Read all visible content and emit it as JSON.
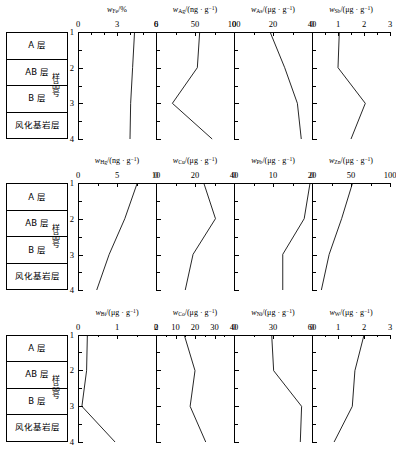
{
  "figure": {
    "y_axis_caption": "样品号",
    "sample_numbers": [
      "1",
      "2",
      "3",
      "4"
    ],
    "stratigraphy": [
      {
        "label": "A 层"
      },
      {
        "label": "AB 层"
      },
      {
        "label": "B 层"
      },
      {
        "label": "风化基\n岩层"
      }
    ]
  },
  "chart_data": {
    "type": "line",
    "title": "",
    "ylabel": "样品号",
    "ylim": [
      1,
      4
    ],
    "y": [
      1,
      2,
      3,
      4
    ],
    "grid": false,
    "legend": "none",
    "orientation": "depth-profile (y inverted, sample number increases downward)",
    "panels": [
      {
        "row": 1,
        "col": 1,
        "element": "Fe",
        "symbol": "w",
        "subscript": "Fe",
        "unit": "%",
        "xlabel": "w_Fe/%",
        "xlim": [
          0,
          6
        ],
        "xticks": [
          0,
          3,
          6
        ],
        "xticklabels": [
          "0",
          "3",
          "6"
        ],
        "minor_ticks": [
          1,
          2,
          4,
          5
        ],
        "values": [
          4.35,
          4.2,
          4.05,
          4.0
        ]
      },
      {
        "row": 1,
        "col": 2,
        "element": "Ag",
        "symbol": "w",
        "subscript": "Ag",
        "unit": "ng·g-1",
        "xlabel": "w_Ag/(ng · g^-1)",
        "xlim": [
          0,
          100
        ],
        "xticks": [
          0,
          50,
          100
        ],
        "xticklabels": [
          "0",
          "50",
          "100"
        ],
        "minor_ticks": [
          25,
          75
        ],
        "values": [
          56,
          53,
          21,
          72
        ]
      },
      {
        "row": 1,
        "col": 3,
        "element": "As",
        "symbol": "w",
        "subscript": "As",
        "unit": "μg·g-1",
        "xlabel": "w_As/(μg · g^-1)",
        "xlim": [
          0,
          40
        ],
        "xticks": [
          0,
          20,
          40
        ],
        "xticklabels": [
          "0",
          "20",
          "40"
        ],
        "minor_ticks": [
          10,
          30
        ],
        "values": [
          18.5,
          26.0,
          32.5,
          34.5
        ]
      },
      {
        "row": 1,
        "col": 4,
        "element": "Sb",
        "symbol": "w",
        "subscript": "Sb",
        "unit": "μg·g-1",
        "xlabel": "w_Sb/(μg · g^-1)",
        "xlim": [
          0,
          3
        ],
        "xticks": [
          0,
          1,
          2,
          3
        ],
        "xticklabels": [
          "0",
          "1",
          "2",
          "3"
        ],
        "minor_ticks": [
          0.5,
          1.5,
          2.5
        ],
        "values": [
          1.05,
          1.0,
          2.05,
          1.5
        ]
      },
      {
        "row": 2,
        "col": 1,
        "element": "Hg",
        "symbol": "w",
        "subscript": "Hg",
        "unit": "ng·g-1",
        "xlabel": "w_Hg/(ng · g^-1)",
        "xlim": [
          0,
          10
        ],
        "xticks": [
          0,
          5,
          10
        ],
        "xticklabels": [
          "0",
          "5",
          "10"
        ],
        "minor_ticks": [
          2.5,
          7.5
        ],
        "values": [
          7.6,
          6.0,
          4.0,
          2.4
        ]
      },
      {
        "row": 2,
        "col": 2,
        "element": "Cu",
        "symbol": "w",
        "subscript": "Cu",
        "unit": "μg·g-1",
        "xlabel": "w_Cu/(μg · g^-1)",
        "xlim": [
          0,
          40
        ],
        "xticks": [
          0,
          20,
          40
        ],
        "xticklabels": [
          "0",
          "20",
          "40"
        ],
        "minor_ticks": [
          10,
          30
        ],
        "values": [
          24.5,
          30.5,
          19.0,
          15.0
        ]
      },
      {
        "row": 2,
        "col": 3,
        "element": "Pb",
        "symbol": "w",
        "subscript": "Pb",
        "unit": "μg·g-1",
        "xlabel": "w_Pb/(μg · g^-1)",
        "xlim": [
          0,
          20
        ],
        "xticks": [
          0,
          10,
          20
        ],
        "xticklabels": [
          "0",
          "10",
          "20"
        ],
        "minor_ticks": [
          5,
          15
        ],
        "values": [
          19.5,
          18.0,
          12.5,
          12.5
        ]
      },
      {
        "row": 2,
        "col": 4,
        "element": "Zn",
        "symbol": "w",
        "subscript": "Zn",
        "unit": "μg·g-1",
        "xlabel": "w_Zn/(μg · g^-1)",
        "xlim": [
          0,
          100
        ],
        "xticks": [
          0,
          50,
          100
        ],
        "xticklabels": [
          "0",
          "50",
          "100"
        ],
        "minor_ticks": [
          25,
          75
        ],
        "values": [
          52,
          38,
          22,
          12
        ]
      },
      {
        "row": 3,
        "col": 1,
        "element": "Bi",
        "symbol": "w",
        "subscript": "Bi",
        "unit": "μg·g-1",
        "xlabel": "w_Bi/(μg · g^-1)",
        "xlim": [
          0,
          2
        ],
        "xticks": [
          0,
          1,
          2
        ],
        "xticklabels": [
          "0",
          "1",
          "2"
        ],
        "minor_ticks": [
          0.5,
          1.5
        ],
        "values": [
          0.24,
          0.22,
          0.1,
          0.95
        ]
      },
      {
        "row": 3,
        "col": 2,
        "element": "Co",
        "symbol": "w",
        "subscript": "Co",
        "unit": "μg·g-1",
        "xlabel": "w_Co/(μg · g^-1)",
        "xlim": [
          0,
          40
        ],
        "xticks": [
          0,
          10,
          20,
          30,
          40
        ],
        "xticklabels": [
          "0",
          "10",
          "20",
          "30",
          "40"
        ],
        "minor_ticks": [
          5,
          15,
          25,
          35
        ],
        "values": [
          14.5,
          20.0,
          17.5,
          25.5
        ]
      },
      {
        "row": 3,
        "col": 3,
        "element": "Ni",
        "symbol": "w",
        "subscript": "Ni",
        "unit": "μg·g-1",
        "xlabel": "w_Ni/(μg · g^-1)",
        "xlim": [
          0,
          60
        ],
        "xticks": [
          0,
          30,
          60
        ],
        "xticklabels": [
          "0",
          "30",
          "60"
        ],
        "minor_ticks": [
          15,
          45
        ],
        "values": [
          29.0,
          30.5,
          52.0,
          51.0
        ]
      },
      {
        "row": 3,
        "col": 4,
        "element": "W",
        "symbol": "w",
        "subscript": "W",
        "unit": "μg·g-1",
        "xlabel": "w_W/(μg · g^-1)",
        "xlim": [
          0,
          3
        ],
        "xticks": [
          0,
          1,
          2,
          3
        ],
        "xticklabels": [
          "0",
          "1",
          "2",
          "3"
        ],
        "minor_ticks": [
          0.5,
          1.5,
          2.5
        ],
        "values": [
          2.0,
          1.65,
          1.55,
          0.85
        ]
      }
    ]
  }
}
